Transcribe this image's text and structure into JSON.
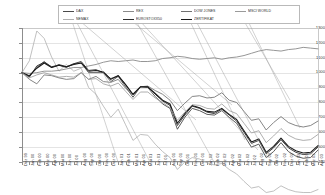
{
  "chart": {
    "type": "line",
    "title": "",
    "xlabel": "",
    "ylabel": "",
    "ylim": [
      400,
      1300
    ],
    "ytick_labels": [
      "1300",
      "1200",
      "1100",
      "1000",
      "900",
      "800",
      "700",
      "600",
      "500",
      "400"
    ],
    "ytick_values": [
      1300,
      1200,
      1100,
      1000,
      900,
      800,
      700,
      600,
      500,
      400
    ],
    "grid": true,
    "legend_position": "top",
    "base_index": 1000
  },
  "legend": {
    "entries": [
      {
        "label": "DAX",
        "color": "#4a4a4a",
        "column": 0,
        "row": 0
      },
      {
        "label": "NEMAX",
        "color": "#b0b0b0",
        "column": 0,
        "row": 1
      },
      {
        "label": "REX",
        "color": "#8a8a8a",
        "column": 1,
        "row": 0
      },
      {
        "label": "EUROSTOXX50",
        "color": "#2f2f2f",
        "column": 1,
        "row": 1
      },
      {
        "label": "DOW JONES",
        "color": "#707070",
        "column": 2,
        "row": 0
      },
      {
        "label": "ZERTIFIKAT",
        "color": "#1a1a1a",
        "column": 2,
        "row": 1
      },
      {
        "label": "MSCI WORLD",
        "color": "#9a9a9a",
        "column": 3,
        "row": 0
      }
    ]
  },
  "chart_data": {
    "type": "line",
    "title": "",
    "xlabel": "",
    "ylabel": "",
    "ylim": [
      400,
      1300
    ],
    "grid": true,
    "legend_position": "top",
    "categories": [
      "Dez 99",
      "Jan 00",
      "Feb 00",
      "Mrz 00",
      "Apr 00",
      "Mai 00",
      "Jun 00",
      "Jul 00",
      "Aug 00",
      "Sep 00",
      "Okt 00",
      "Nov 00",
      "Dez 00",
      "Jan 01",
      "Feb 01",
      "Mrz 01",
      "Apr 01",
      "Mai 01",
      "Jun 01",
      "Jul 01",
      "Aug 01",
      "Sep 01",
      "Okt 01",
      "Nov 01",
      "Dez 01",
      "Jan 02",
      "Feb 02",
      "Mrz 02",
      "Apr 02",
      "Mai 02",
      "Jun 02",
      "Jul 02",
      "Aug 02",
      "Sep 02",
      "Okt 02",
      "Nov 02",
      "Dez 02",
      "Jan 03",
      "Feb 03",
      "Mrz 03",
      "Apr 03"
    ],
    "series": [
      {
        "name": "DAX",
        "color": "#4a4a4a",
        "width": 0.9,
        "values": [
          1000,
          975,
          1035,
          1075,
          1035,
          1055,
          1040,
          1060,
          1065,
          1000,
          1000,
          1000,
          940,
          975,
          905,
          835,
          905,
          900,
          840,
          790,
          760,
          620,
          700,
          760,
          745,
          720,
          715,
          745,
          700,
          660,
          580,
          500,
          520,
          430,
          470,
          530,
          470,
          440,
          425,
          430,
          480
        ]
      },
      {
        "name": "NEMAX",
        "color": "#b0b0b0",
        "width": 0.8,
        "values": [
          1000,
          1080,
          1280,
          1230,
          1105,
          1010,
          1055,
          1010,
          1030,
          900,
          855,
          775,
          700,
          755,
          650,
          545,
          585,
          580,
          520,
          470,
          430,
          350,
          400,
          430,
          420,
          395,
          380,
          390,
          350,
          320,
          270,
          225,
          235,
          195,
          205,
          240,
          215,
          200,
          195,
          195,
          215
        ]
      },
      {
        "name": "REX",
        "color": "#8a8a8a",
        "width": 0.9,
        "values": [
          1000,
          995,
          1000,
          1010,
          1010,
          1015,
          1025,
          1035,
          1035,
          1045,
          1055,
          1070,
          1080,
          1075,
          1080,
          1085,
          1075,
          1075,
          1080,
          1095,
          1100,
          1110,
          1105,
          1095,
          1090,
          1095,
          1100,
          1090,
          1100,
          1105,
          1115,
          1130,
          1145,
          1155,
          1150,
          1145,
          1155,
          1160,
          1170,
          1165,
          1160
        ]
      },
      {
        "name": "EUROSTOXX50",
        "color": "#2f2f2f",
        "width": 0.9,
        "values": [
          1000,
          970,
          1045,
          1070,
          1040,
          1050,
          1035,
          1060,
          1075,
          1015,
          1020,
          1000,
          960,
          980,
          920,
          850,
          905,
          905,
          855,
          810,
          780,
          645,
          715,
          775,
          760,
          735,
          725,
          755,
          715,
          675,
          600,
          525,
          545,
          455,
          495,
          550,
          495,
          465,
          450,
          455,
          500
        ]
      },
      {
        "name": "DOW JONES",
        "color": "#707070",
        "width": 0.85,
        "values": [
          1000,
          955,
          925,
          985,
          980,
          965,
          955,
          960,
          1000,
          955,
          975,
          940,
          935,
          955,
          895,
          850,
          905,
          910,
          880,
          855,
          815,
          745,
          795,
          840,
          845,
          830,
          835,
          865,
          815,
          800,
          740,
          680,
          690,
          615,
          665,
          705,
          665,
          645,
          635,
          645,
          675
        ]
      },
      {
        "name": "ZERTIFIKAT",
        "color": "#1a1a1a",
        "width": 1.1,
        "values": [
          1000,
          980,
          1030,
          1065,
          1035,
          1050,
          1040,
          1055,
          1065,
          1010,
          1015,
          1005,
          955,
          980,
          920,
          855,
          905,
          905,
          860,
          815,
          790,
          660,
          725,
          780,
          765,
          740,
          735,
          760,
          720,
          685,
          610,
          535,
          555,
          465,
          505,
          560,
          505,
          475,
          460,
          465,
          510
        ]
      },
      {
        "name": "MSCI WORLD",
        "color": "#9a9a9a",
        "width": 0.8,
        "values": [
          1000,
          965,
          985,
          1000,
          985,
          970,
          975,
          970,
          1000,
          955,
          960,
          925,
          910,
          930,
          875,
          820,
          870,
          870,
          830,
          800,
          765,
          680,
          735,
          785,
          780,
          760,
          755,
          790,
          745,
          725,
          660,
          595,
          610,
          530,
          575,
          625,
          580,
          555,
          545,
          550,
          585
        ]
      }
    ]
  }
}
